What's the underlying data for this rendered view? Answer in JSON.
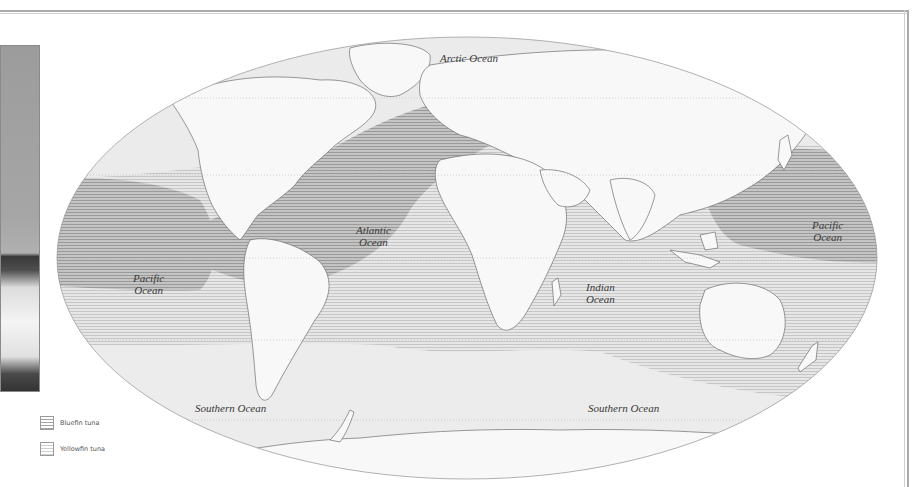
{
  "map": {
    "projection": "Robinson",
    "colors": {
      "land": "#f7f7f7",
      "coastline": "#6a6a6a",
      "ocean_base": "#ebebeb",
      "bluefin_hatch": "#a4a4a4",
      "yellowfin_hatch": "#cfcfcf",
      "frame": "#a9a9a9"
    },
    "ocean_labels": {
      "arctic": "Arctic Ocean",
      "atlantic_line1": "Atlantic",
      "atlantic_line2": "Ocean",
      "pacific_west_line1": "Pacific",
      "pacific_west_line2": "Ocean",
      "pacific_east_line1": "Pacific",
      "pacific_east_line2": "Ocean",
      "indian_line1": "Indian",
      "indian_line2": "Ocean",
      "southern_west": "Southern Ocean",
      "southern_east": "Southern Ocean"
    }
  },
  "legend": {
    "items": [
      {
        "label": "Bluefin tuna",
        "pattern": "dense-horizontal-hatch"
      },
      {
        "label": "Yellowfin tuna",
        "pattern": "light-horizontal-hatch"
      }
    ]
  },
  "photo": {
    "subject": "ocean-wave"
  }
}
